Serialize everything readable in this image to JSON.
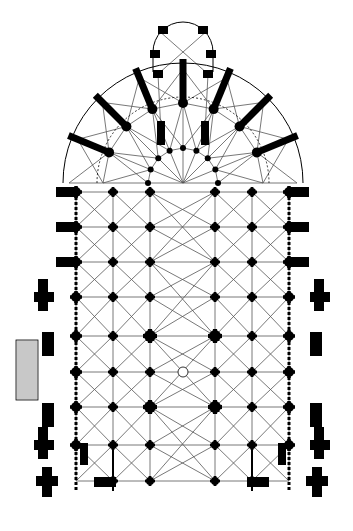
{
  "figure": {
    "background": "#ffffff",
    "ink": "#000000",
    "rib_color": "#555555",
    "hatch_color": "#888888"
  },
  "grid": {
    "columns_x": [
      76,
      113,
      150,
      215,
      252,
      289
    ],
    "rows_y": [
      192,
      227,
      262,
      297,
      336,
      372,
      407,
      445,
      481
    ],
    "crossing_center": [
      183,
      372
    ]
  },
  "chevet": {
    "hemicycle_center": [
      183,
      183
    ],
    "inner_radius": 35,
    "ambulatory_radius": 80,
    "outer_wall_radius": 120,
    "axial_chapel_center": [
      183,
      52
    ],
    "axial_chapel_radius": 30
  },
  "annex": {
    "label": "",
    "x": 16,
    "y": 340,
    "w": 22,
    "h": 60
  }
}
